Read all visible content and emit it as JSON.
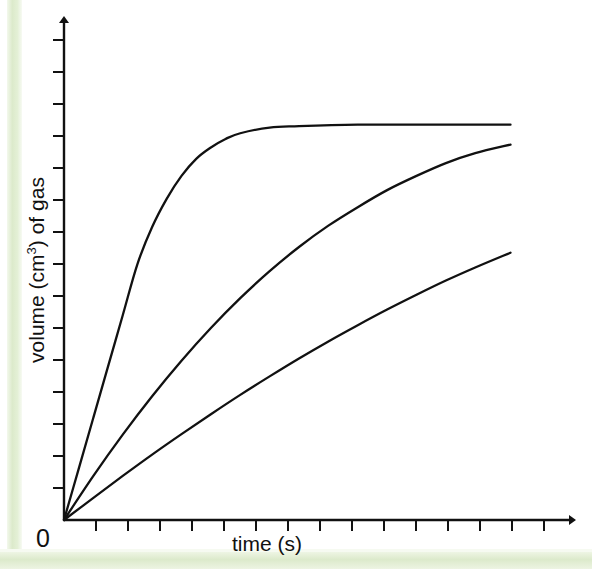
{
  "figure": {
    "background_color": "#ffffff",
    "accent_band_color": "#dceacb",
    "line_color": "#111111",
    "origin_label": "0",
    "ylabel_prefix": "volume (cm",
    "ylabel_exponent": "3",
    "ylabel_suffix": ") of gas"
  },
  "chart_data": {
    "type": "line",
    "title": "",
    "xlabel": "time (s)",
    "ylabel": "volume (cm3) of gas",
    "ylabel_display": "volume (cm³) of gas",
    "grid": false,
    "legend": false,
    "axis_style": "arrow-tipped axes with unlabelled tick marks",
    "xlim": [
      0,
      16
    ],
    "ylim": [
      0,
      16
    ],
    "x_tick_count": 15,
    "y_tick_count": 15,
    "x_tick_labels": [
      "0"
    ],
    "y_tick_labels": [],
    "annotations": [
      "0"
    ],
    "series": [
      {
        "name": "fastest reaction (highest rate, plateaus first)",
        "description": "steep initial gradient, levels off early at the maximum volume",
        "x": [
          0,
          0.5,
          1.0,
          1.5,
          2.0,
          2.5,
          3.0,
          3.5,
          4.0,
          4.5,
          5.0,
          5.5,
          6.0,
          7.0,
          8.0,
          10.0,
          12.0,
          14.0,
          15.2
        ],
        "y": [
          0,
          1.8,
          3.6,
          5.4,
          7.2,
          9.0,
          10.3,
          11.3,
          12.1,
          12.7,
          13.1,
          13.4,
          13.6,
          13.8,
          13.85,
          13.9,
          13.9,
          13.9,
          13.9
        ],
        "plateau_value": 13.9,
        "plateau_starts_at_x": 7.0
      },
      {
        "name": "medium reaction (moderate rate, same final volume trend)",
        "description": "gentler curve, still rising at the end of the experiment",
        "x": [
          0,
          1.0,
          2.0,
          3.0,
          4.0,
          5.0,
          6.0,
          7.0,
          8.0,
          9.0,
          10.0,
          11.0,
          12.0,
          13.0,
          14.0,
          15.2
        ],
        "y": [
          0,
          1.55,
          3.0,
          4.35,
          5.6,
          6.75,
          7.8,
          8.75,
          9.6,
          10.35,
          11.0,
          11.6,
          12.1,
          12.55,
          12.9,
          13.2
        ],
        "plateau_value": null,
        "plateau_starts_at_x": null
      },
      {
        "name": "slowest reaction (lowest rate)",
        "description": "nearly straight, shallow gradient, lowest volume at the end",
        "x": [
          0,
          1.0,
          2.0,
          3.0,
          4.0,
          5.0,
          6.0,
          7.0,
          8.0,
          9.0,
          10.0,
          11.0,
          12.0,
          13.0,
          14.0,
          15.2
        ],
        "y": [
          0,
          0.78,
          1.55,
          2.3,
          3.02,
          3.72,
          4.4,
          5.05,
          5.68,
          6.28,
          6.85,
          7.4,
          7.92,
          8.42,
          8.88,
          9.4
        ],
        "plateau_value": null,
        "plateau_starts_at_x": null
      }
    ]
  }
}
